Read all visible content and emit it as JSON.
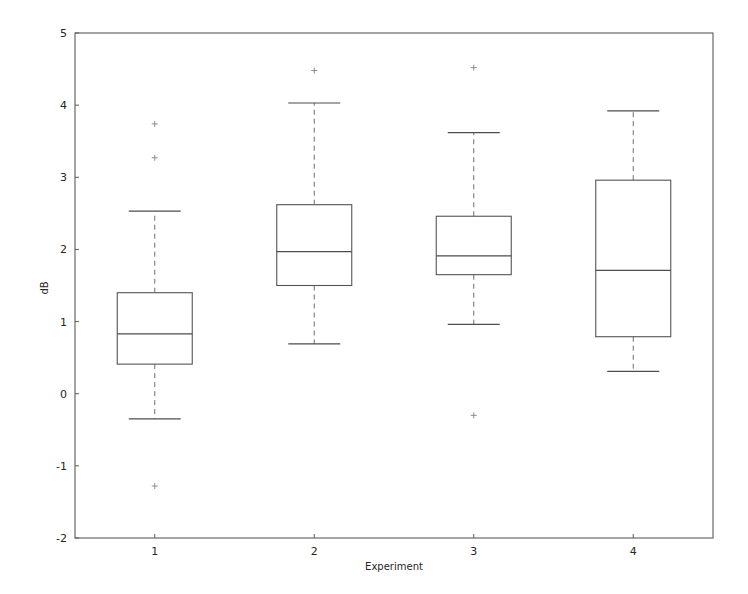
{
  "chart_data": {
    "type": "box",
    "title": "",
    "xlabel": "Experiment",
    "ylabel": "dB",
    "categories": [
      "1",
      "2",
      "3",
      "4"
    ],
    "xtick_labels": [
      "1",
      "2",
      "3",
      "4"
    ],
    "ytick_labels": [
      "-2",
      "-1",
      "0",
      "1",
      "2",
      "3",
      "4",
      "5"
    ],
    "yticks": [
      -2,
      -1,
      0,
      1,
      2,
      3,
      4,
      5
    ],
    "ylim": [
      -2,
      5
    ],
    "xlim": [
      0.5,
      4.5
    ],
    "grid": false,
    "legend": null,
    "boxes": [
      {
        "category": "1",
        "whisker_low": -0.35,
        "q1": 0.41,
        "median": 0.83,
        "q3": 1.4,
        "whisker_high": 2.53,
        "outliers": [
          3.74,
          3.27,
          -1.28
        ]
      },
      {
        "category": "2",
        "whisker_low": 0.69,
        "q1": 1.5,
        "median": 1.97,
        "q3": 2.62,
        "whisker_high": 4.03,
        "outliers": [
          4.48
        ]
      },
      {
        "category": "3",
        "whisker_low": 0.96,
        "q1": 1.65,
        "median": 1.91,
        "q3": 2.46,
        "whisker_high": 3.62,
        "outliers": [
          4.52,
          -0.3
        ]
      },
      {
        "category": "4",
        "whisker_low": 0.31,
        "q1": 0.79,
        "median": 1.71,
        "q3": 2.96,
        "whisker_high": 3.92,
        "outliers": []
      }
    ],
    "style": {
      "box_edge_color": "#545454",
      "median_color": "#4d4d4d",
      "whisker_color": "#6e6e6e",
      "cap_color": "#4d4d4d",
      "flier_color": "#8c8c8c",
      "axis_color": "#5b5b5b",
      "background": "#ffffff"
    }
  }
}
